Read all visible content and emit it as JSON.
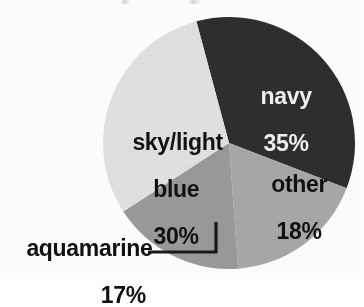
{
  "chart_data": {
    "type": "pie",
    "title": "",
    "xlabel": "",
    "ylabel": "",
    "categories": [
      "navy",
      "other",
      "aquamarine",
      "sky/light blue"
    ],
    "values": [
      35,
      18,
      17,
      30
    ],
    "value_suffix": "%",
    "legend_position": "none",
    "grid": false,
    "slices": [
      {
        "name": "navy",
        "label": "navy",
        "value": 35,
        "value_label": "35%",
        "color": "#2e2e2e",
        "text_color": "#f2f2f2",
        "label_placement": "inside",
        "start_angle_deg": 345,
        "end_angle_deg": 471
      },
      {
        "name": "other",
        "label": "other",
        "value": 18,
        "value_label": "18%",
        "color": "#a8a8a8",
        "text_color": "#111111",
        "label_placement": "inside",
        "start_angle_deg": 471,
        "end_angle_deg": 535.8
      },
      {
        "name": "aquamarine",
        "label": "aquamarine",
        "value": 17,
        "value_label": "17%",
        "color": "#9a9a9a",
        "text_color": "#111111",
        "label_placement": "outside-callout",
        "start_angle_deg": 535.8,
        "end_angle_deg": 597
      },
      {
        "name": "sky/light blue",
        "label_lines": [
          "sky/light",
          "blue"
        ],
        "label": "sky/light blue",
        "value": 30,
        "value_label": "30%",
        "color": "#e2e2e2",
        "text_color": "#111111",
        "label_placement": "inside",
        "start_angle_deg": 597,
        "end_angle_deg": 705
      }
    ]
  },
  "labels": {
    "navy_name": "navy",
    "navy_pct": "35%",
    "other_name": "other",
    "other_pct": "18%",
    "sky_line1": "sky/light",
    "sky_line2": "blue",
    "sky_pct": "30%",
    "aqua_name": "aquamarine",
    "aqua_pct": "17%"
  },
  "colors": {
    "navy": "#2e2e2e",
    "other": "#a8a8a8",
    "aquamarine": "#9a9a9a",
    "sky_light_blue": "#e2e2e2",
    "background": "#ffffff",
    "leader_line": "#1a1a1a",
    "label_dark": "#111111",
    "label_light": "#f2f2f2"
  },
  "geometry": {
    "center_x": 229,
    "center_y": 143,
    "radius": 126
  }
}
